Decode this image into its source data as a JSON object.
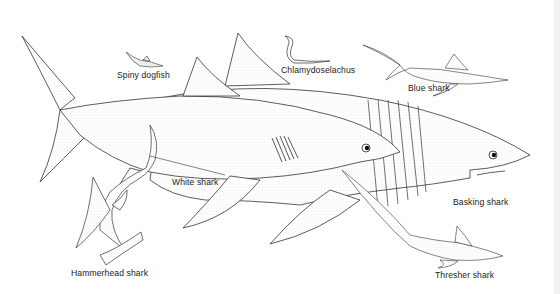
{
  "illustration": {
    "subject": "Shark species comparison drawing",
    "labels": {
      "spiny_dogfish": "Spiny dogfish",
      "chlamydoselachus": "Chlamydoselachus",
      "blue_shark": "Blue shark",
      "white_shark": "White shark",
      "basking_shark": "Basking shark",
      "hammerhead_shark": "Hammerhead shark",
      "thresher_shark": "Thresher shark"
    },
    "colors": {
      "background": "#ffffff",
      "ink": "#222222",
      "shading": "#bdbdbd"
    }
  }
}
